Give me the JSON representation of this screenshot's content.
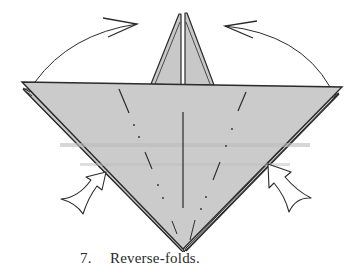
{
  "figure": {
    "step_number": "7.",
    "caption_text": "Reverse-folds.",
    "colors": {
      "paper_fill": "#c8c8c8",
      "paper_fill_light": "#cfcfcf",
      "line": "#2b2b2b",
      "background": "#ffffff",
      "arrow_fill": "#ffffff"
    },
    "elements": {
      "main_triangle": "folded paper base (inverted triangle)",
      "top_flap": "vertical point flap",
      "left_arc_arrow": "fold-over arrow (left)",
      "right_arc_arrow": "fold-over arrow (right)",
      "left_push_arrow": "reverse-fold push arrow (left)",
      "right_push_arrow": "reverse-fold push arrow (right)"
    }
  }
}
